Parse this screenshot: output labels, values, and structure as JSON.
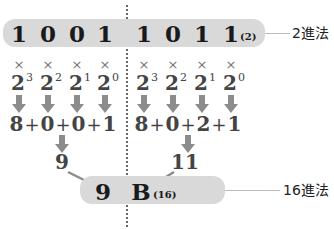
{
  "binary": {
    "digits_left": [
      "1",
      "0",
      "0",
      "1"
    ],
    "digits_right": [
      "1",
      "0",
      "1",
      "1"
    ],
    "base_subscript": "(2)",
    "label": "2進法"
  },
  "multiply_symbol": "×",
  "powers": {
    "base": "2",
    "exponents_left": [
      "3",
      "2",
      "1",
      "0"
    ],
    "exponents_right": [
      "3",
      "2",
      "1",
      "0"
    ]
  },
  "sums": {
    "left": [
      "8",
      "+",
      "0",
      "+",
      "0",
      "+",
      "1"
    ],
    "right": [
      "8",
      "+",
      "0",
      "+",
      "2",
      "+",
      "1"
    ]
  },
  "results": {
    "left": "9",
    "right": "11"
  },
  "hex": {
    "digit_left": "9",
    "digit_right": "B",
    "base_subscript": "(16)",
    "label": "16進法"
  },
  "colors": {
    "pill": "#d9d9d9",
    "arrow": "#8c8c8c",
    "divider": "#666666",
    "connector": "#bbbbbb"
  }
}
